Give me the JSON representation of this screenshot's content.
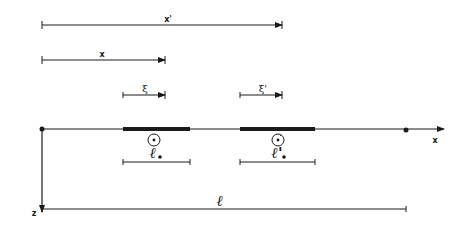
{
  "diagram": {
    "labels": {
      "x_prime": "x'",
      "x": "x",
      "xi": "ξ",
      "xi_prime": "ξ'",
      "x_axis": "x",
      "z_axis": "z",
      "ell_e": "ℓ",
      "ell_e_sub": "e",
      "ell_e_prime": "ℓ'",
      "ell_e_prime_sub": "e",
      "ell": "ℓ",
      "element_marker": "e",
      "element_marker_prime": "e'"
    },
    "colors": {
      "ink": "#1a1a1a",
      "background": "#ffffff"
    }
  }
}
